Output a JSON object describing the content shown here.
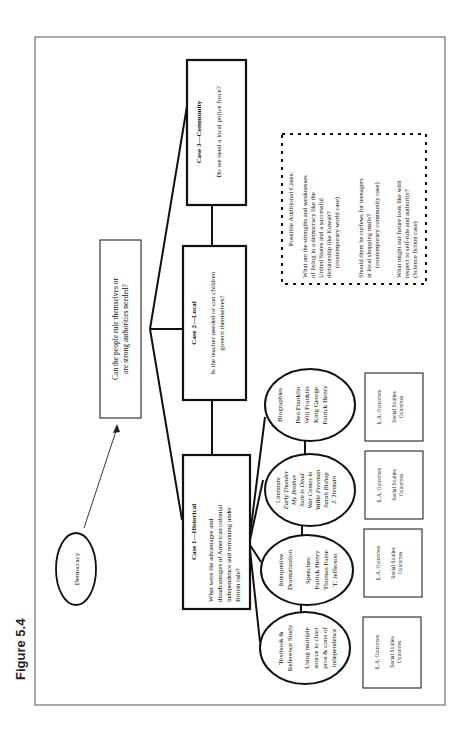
{
  "figure_label": "Figure 5.4",
  "root": {
    "label": "Democracy"
  },
  "central_question": {
    "lines": [
      "Can the people rule themselves or",
      "are strong authorities needed?"
    ]
  },
  "cases": [
    {
      "title": "Case 1—Historical",
      "question_lines": [
        "What were the advantages and",
        "disadvantages of American colonial",
        "independence and remaining under",
        "British rule?"
      ]
    },
    {
      "title": "Case 2—Local",
      "question_lines": [
        "Is the teacher needed or can children",
        "govern themselves?"
      ]
    },
    {
      "title": "Case 3—Community",
      "question_lines": [
        "Do we need a local police force?"
      ]
    }
  ],
  "activities": [
    {
      "title_lines": [
        "Textbook &",
        "Reference Study"
      ],
      "detail_lines": [
        "Using multiple",
        "source to chart",
        "pros & cons of",
        "independence"
      ]
    },
    {
      "title_lines": [
        "Interpretive",
        "Dramatization"
      ],
      "detail_lines": [
        "Speeches:",
        "Patrick Henry",
        "Thomas Paine",
        "T. Jefferson"
      ]
    },
    {
      "title_lines": [
        "Literature"
      ],
      "detail_lines": [
        "Early Thunder",
        "My Brother",
        "Sam is Dead",
        "War Comes to",
        "Willie Freeman",
        "Sarah Bishop",
        "J. Tremain"
      ]
    },
    {
      "title_lines": [
        "Biographies"
      ],
      "detail_lines": [
        "Ben Franklin",
        "Will Franklin",
        "King George",
        "Patrick Henry"
      ]
    }
  ],
  "outcomes": [
    {
      "la": "L.A. Outcomes",
      "ss_lines": [
        "Social Studies",
        "Outcomes"
      ]
    },
    {
      "la": "L.A. Outcomes",
      "ss_lines": [
        "Social Studies",
        "Outcomes"
      ]
    },
    {
      "la": "L.A. Outcomes",
      "ss_lines": [
        "Social Studies",
        "Outcomes"
      ]
    },
    {
      "la": "L.A. Outcomes",
      "ss_lines": [
        "Social Studies",
        "Outcomes"
      ]
    }
  ],
  "additional_cases": {
    "heading": "Possible Additional Cases:",
    "items": [
      {
        "lines": [
          "What are the strengths and weaknesses",
          "of living in a democracy like the",
          "United States and a successful",
          "dictatorship like Kuwait?",
          "(contemporary world case)"
        ]
      },
      {
        "lines": [
          "Should there be curfews for teenagers",
          "at local shopping malls?",
          "(contemporary community case)"
        ]
      },
      {
        "lines": [
          "What might our future look like with",
          "respect to self-rule and authority?",
          "(Science fiction case)"
        ]
      }
    ]
  }
}
